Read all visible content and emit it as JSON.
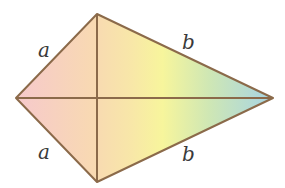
{
  "diagram": {
    "type": "kite",
    "vertices": {
      "left": [
        16,
        98
      ],
      "top": [
        97,
        14
      ],
      "right": [
        273,
        98
      ],
      "bottom": [
        97,
        182
      ]
    },
    "labels": {
      "top_left": "a",
      "bottom_left": "a",
      "top_right": "b",
      "bottom_right": "b"
    },
    "colors": {
      "stroke": "#8b6a4a",
      "gradient": [
        "#f5c6c8",
        "#f8d9b0",
        "#f7e9a6",
        "#f6f59a",
        "#cfe8b0",
        "#a8d6e0"
      ]
    }
  }
}
